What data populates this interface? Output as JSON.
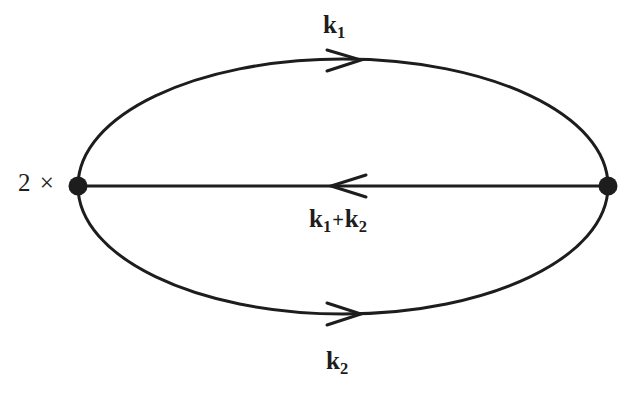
{
  "figure": {
    "type": "feynman-diagram",
    "background_color": "#ffffff",
    "ink_color": "#1d1d1d",
    "width": 637,
    "height": 393
  },
  "multiplier": {
    "text": "2 ×"
  },
  "labels": {
    "top": {
      "symbol": "k",
      "subscript": "1"
    },
    "middle": {
      "symbol_left": "k",
      "subscript_left": "1",
      "operator": "+",
      "symbol_right": "k",
      "subscript_right": "2"
    },
    "bottom": {
      "symbol": "k",
      "subscript": "2"
    }
  },
  "geometry": {
    "ellipse": {
      "cx": 343,
      "cy": 187,
      "rx": 265,
      "ry": 128
    },
    "vertices": [
      {
        "name": "left-vertex",
        "cx": 78,
        "cy": 186,
        "r": 9
      },
      {
        "name": "right-vertex",
        "cx": 608,
        "cy": 186,
        "r": 9
      }
    ],
    "edges": [
      {
        "name": "top-arc",
        "direction": "right",
        "arrow_x": 348,
        "arrow_y": 60
      },
      {
        "name": "middle-line",
        "direction": "left",
        "arrow_x": 348,
        "arrow_y": 186
      },
      {
        "name": "bottom-arc",
        "direction": "right",
        "arrow_x": 348,
        "arrow_y": 314
      }
    ],
    "stroke_width": 3
  }
}
